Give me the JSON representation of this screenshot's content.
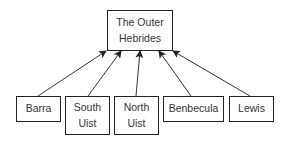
{
  "diagram": {
    "type": "hierarchy",
    "root": {
      "id": "root",
      "label": "The Outer\nHebrides"
    },
    "children": [
      {
        "id": "barra",
        "label": "Barra"
      },
      {
        "id": "south-uist",
        "label": "South\nUist"
      },
      {
        "id": "north-uist",
        "label": "North\nUist"
      },
      {
        "id": "benbecula",
        "label": "Benbecula"
      },
      {
        "id": "lewis",
        "label": "Lewis"
      }
    ],
    "edges": [
      {
        "from": "barra",
        "to": "root"
      },
      {
        "from": "south-uist",
        "to": "root"
      },
      {
        "from": "north-uist",
        "to": "root"
      },
      {
        "from": "benbecula",
        "to": "root"
      },
      {
        "from": "lewis",
        "to": "root"
      }
    ]
  }
}
